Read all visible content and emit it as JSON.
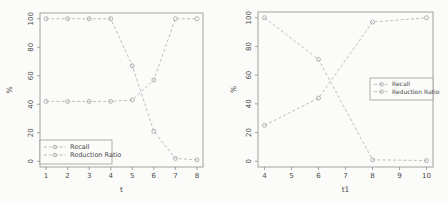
{
  "figure": {
    "background": "#fbfbf9"
  },
  "style": {
    "axis_color": "#8d8d8d",
    "tick_color": "#8d8d8d",
    "text_color": "#4a4a4a",
    "series_color": "#b7b7b7",
    "marker_color": "#a9a9a9",
    "legend_border_color": "#8f8f8f",
    "legend_bg": "#fbfbf9"
  },
  "chart_data": [
    {
      "type": "line",
      "title": "",
      "xlabel": "t",
      "ylabel": "%",
      "xlim": [
        1,
        8
      ],
      "ylim": [
        0,
        100
      ],
      "xticks": [
        1,
        2,
        3,
        4,
        5,
        6,
        7,
        8
      ],
      "yticks": [
        0,
        20,
        40,
        60,
        80,
        100
      ],
      "x": [
        1,
        2,
        3,
        4,
        5,
        6,
        7,
        8
      ],
      "series": [
        {
          "name": "Recall",
          "values": [
            42,
            42,
            42,
            42,
            43,
            57,
            100,
            100
          ]
        },
        {
          "name": "Reduction Ratio",
          "values": [
            100,
            100,
            100,
            100,
            67,
            21,
            2,
            1
          ]
        }
      ],
      "grid": false,
      "line_style": "dashed",
      "marker": "circle",
      "legend_position": "bottom-left",
      "legend_items": [
        "Recall",
        "Reduction Ratio"
      ]
    },
    {
      "type": "line",
      "title": "",
      "xlabel": "t1",
      "ylabel": "%",
      "xlim": [
        4,
        10
      ],
      "ylim": [
        0,
        100
      ],
      "xticks": [
        4,
        5,
        6,
        7,
        8,
        9,
        10
      ],
      "yticks": [
        0,
        20,
        40,
        60,
        80,
        100
      ],
      "x": [
        4,
        6,
        8,
        10
      ],
      "series": [
        {
          "name": "Recall",
          "values": [
            25,
            44,
            97,
            100
          ]
        },
        {
          "name": "Reduction Ratio",
          "values": [
            100,
            71,
            1,
            0.5
          ]
        }
      ],
      "grid": false,
      "line_style": "dashed",
      "marker": "circle",
      "legend_position": "middle-right",
      "legend_items": [
        "Recall",
        "Reduction Ratio"
      ]
    }
  ]
}
